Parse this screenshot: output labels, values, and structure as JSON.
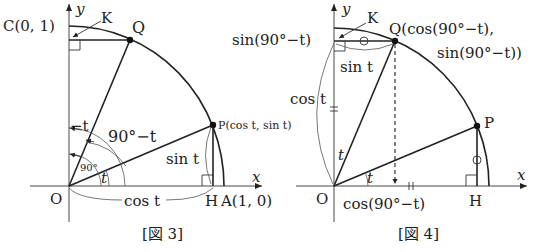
{
  "figures": [
    {
      "caption": "[図 3]",
      "axes": {
        "x_label": "x",
        "y_label": "y"
      },
      "points": {
        "origin": "O",
        "C": "C(0, 1)",
        "K": "K",
        "Q": "Q",
        "P": "P(cos t, sin t)",
        "H": "H",
        "A": "A(1, 0)"
      },
      "angle_labels": {
        "t": "t",
        "ninety": "90°",
        "ninety_minus_t": "90°−t",
        "minus_t": "−t"
      },
      "segment_labels": {
        "sin_t": "sin t",
        "cos_t": "cos t"
      }
    },
    {
      "caption": "[図 4]",
      "axes": {
        "x_label": "x",
        "y_label": "y"
      },
      "points": {
        "origin": "O",
        "K": "K",
        "Q_line1": "Q(cos(90°−t),",
        "Q_line2": "sin(90°−t))",
        "P": "P",
        "H": "H"
      },
      "angle_labels": {
        "t_upper": "t",
        "t_lower": "t"
      },
      "segment_labels": {
        "sin_90_minus_t": "sin(90°−t)",
        "sin_t": "sin t",
        "cos_t": "cos t",
        "cos_90_minus_t": "cos(90°−t)"
      },
      "marks": {
        "circle_mark": "○",
        "double_tick": "="
      }
    }
  ]
}
